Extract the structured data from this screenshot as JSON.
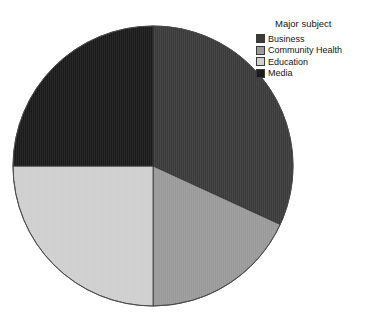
{
  "page": {
    "clipped_header_left": "",
    "clipped_header_right": ""
  },
  "legend": {
    "title": "Major subject",
    "items": [
      {
        "label": "Business",
        "color": "#3b3b3b"
      },
      {
        "label": "Community Health",
        "color": "#9a9a9a"
      },
      {
        "label": "Education",
        "color": "#cfcfcf"
      },
      {
        "label": "Media",
        "color": "#1b1b1b"
      }
    ]
  },
  "chart_data": {
    "type": "pie",
    "title": "Major subject",
    "xlabel": "",
    "ylabel": "",
    "categories": [
      "Business",
      "Community Health",
      "Education",
      "Media"
    ],
    "values": [
      31.9,
      18.1,
      25.0,
      25.0
    ],
    "units": "percent",
    "colors": [
      "#3b3b3b",
      "#9a9a9a",
      "#cfcfcf",
      "#1b1b1b"
    ],
    "start_angle_deg": 0,
    "direction": "clockwise",
    "slice_boundaries_deg": [
      0,
      114.7,
      180,
      270,
      360
    ],
    "data_labels_shown": false,
    "grid": false,
    "legend_position": "right",
    "center_px": [
      153,
      166
    ],
    "radius_px": 140
  }
}
